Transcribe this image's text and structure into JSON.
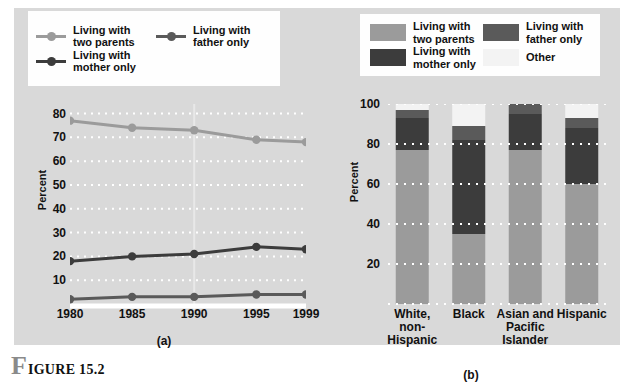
{
  "figure": {
    "caption_initial": "F",
    "caption_rest": "IGURE 15.2"
  },
  "colors": {
    "panel_bg": "#d9d9d9",
    "legend_bg": "#fefefe",
    "two_parents": "#9b9b9b",
    "mother_only": "#3c3c3c",
    "father_only": "#5a5a5a",
    "other": "#f3f3f3",
    "gridline": "#ffffff",
    "axis_text": "#111111"
  },
  "legend_a": {
    "items": [
      {
        "label": "Living with\ntwo parents",
        "marker": "line-dot-marker",
        "color": "#9b9b9b"
      },
      {
        "label": "Living with\nfather only",
        "marker": "line-dot-marker",
        "color": "#5a5a5a"
      },
      {
        "label": "Living with\nmother only",
        "marker": "line-dot-marker",
        "color": "#3c3c3c"
      }
    ]
  },
  "legend_b": {
    "items": [
      {
        "label": "Living with\ntwo parents",
        "marker": "color-swatch",
        "color": "#9b9b9b"
      },
      {
        "label": "Living with\nfather only",
        "marker": "color-swatch",
        "color": "#5a5a5a"
      },
      {
        "label": "Living with\nmother only",
        "marker": "color-swatch",
        "color": "#3c3c3c"
      },
      {
        "label": "Other",
        "marker": "color-swatch",
        "color": "#f3f3f3"
      }
    ]
  },
  "chart_data": [
    {
      "id": "chart-a",
      "type": "line",
      "title": "",
      "sublabel": "(a)",
      "xlabel": "",
      "ylabel": "Percent",
      "x": [
        "1980",
        "1985",
        "1990",
        "1995",
        "1999"
      ],
      "xlim": [
        1980,
        1999
      ],
      "ylim": [
        0,
        84
      ],
      "yticks": [
        80,
        70,
        60,
        50,
        40,
        30,
        20,
        10
      ],
      "grid": true,
      "legend_position": "top",
      "series": [
        {
          "name": "Living with two parents",
          "color": "#9b9b9b",
          "values": [
            77,
            74,
            73,
            69,
            68
          ]
        },
        {
          "name": "Living with mother only",
          "color": "#3c3c3c",
          "values": [
            18,
            20,
            21,
            24,
            23
          ]
        },
        {
          "name": "Living with father only",
          "color": "#5a5a5a",
          "values": [
            2,
            3,
            3,
            4,
            4
          ]
        }
      ]
    },
    {
      "id": "chart-b",
      "type": "bar",
      "stacked": true,
      "title": "",
      "sublabel": "(b)",
      "xlabel": "",
      "ylabel": "Percent",
      "categories": [
        "White,\nnon-Hispanic",
        "Black",
        "Asian and\nPacific\nIslander",
        "Hispanic"
      ],
      "ylim": [
        0,
        100
      ],
      "yticks": [
        100,
        80,
        60,
        40,
        20
      ],
      "grid": true,
      "legend_position": "top",
      "series": [
        {
          "name": "Living with two parents",
          "color": "#9b9b9b",
          "values": [
            77,
            35,
            77,
            60
          ]
        },
        {
          "name": "Living with mother only",
          "color": "#3c3c3c",
          "values": [
            16,
            47,
            18,
            28
          ]
        },
        {
          "name": "Living with father only",
          "color": "#5a5a5a",
          "values": [
            4,
            7,
            5,
            5
          ]
        },
        {
          "name": "Other",
          "color": "#f3f3f3",
          "values": [
            3,
            11,
            0,
            7
          ]
        }
      ]
    }
  ]
}
